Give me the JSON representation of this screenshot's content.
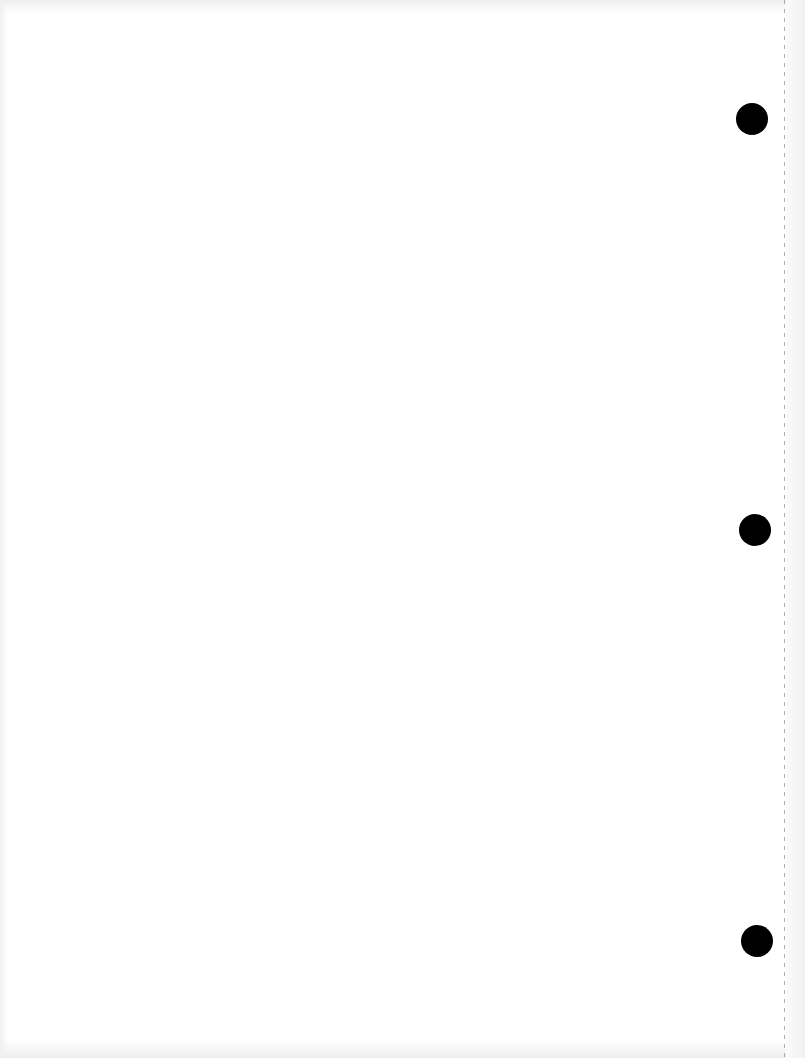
{
  "page": {
    "type": "blank scanned sheet",
    "background_color": "#ffffff",
    "text_content": ""
  },
  "punch_holes": [
    {
      "cx": 752,
      "cy": 119,
      "diameter": 32,
      "color": "#000000"
    },
    {
      "cx": 755,
      "cy": 530,
      "diameter": 32,
      "color": "#000000"
    },
    {
      "cx": 757,
      "cy": 941,
      "diameter": 32,
      "color": "#000000"
    }
  ],
  "perforation_line": {
    "x": 784,
    "style": "dashed",
    "color": "#9c9c9c"
  }
}
